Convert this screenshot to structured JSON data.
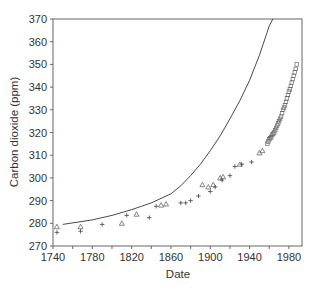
{
  "chart_data": {
    "type": "scatter",
    "title": "",
    "xlabel": "Date",
    "ylabel": "Carbon dioxide (ppm)",
    "xlim": [
      1740,
      1993
    ],
    "ylim": [
      270,
      370
    ],
    "x_ticks": [
      1740,
      1760,
      1780,
      1800,
      1820,
      1840,
      1860,
      1880,
      1900,
      1920,
      1940,
      1960,
      1980
    ],
    "x_tick_labels": [
      "1740",
      "1780",
      "1820",
      "1860",
      "1900",
      "1940",
      "1980"
    ],
    "y_ticks": [
      270,
      280,
      290,
      300,
      310,
      320,
      330,
      340,
      350,
      360,
      370
    ],
    "y_tick_labels": [
      "270",
      "280",
      "290",
      "300",
      "310",
      "320",
      "330",
      "340",
      "350",
      "360",
      "370"
    ],
    "grid": false,
    "legend": null,
    "series": [
      {
        "name": "Model curve",
        "style": "line",
        "x": [
          1750,
          1780,
          1800,
          1820,
          1840,
          1860,
          1870,
          1880,
          1890,
          1900,
          1910,
          1920,
          1930,
          1940,
          1950,
          1960,
          1966
        ],
        "y": [
          279.5,
          281.5,
          283.5,
          286,
          289,
          293,
          296.5,
          301,
          306,
          312,
          318.5,
          326,
          334,
          343,
          354,
          367,
          372
        ]
      },
      {
        "name": "Ice core (triangles)",
        "style": "triangle",
        "x": [
          1744,
          1768,
          1810,
          1825,
          1850,
          1855,
          1892,
          1898,
          1903,
          1910,
          1913,
          1930,
          1950,
          1953
        ],
        "y": [
          278.5,
          278.5,
          280,
          284,
          288,
          288.5,
          297,
          296,
          297,
          300,
          300.5,
          306,
          311,
          312
        ]
      },
      {
        "name": "Ice core (crosses)",
        "style": "cross",
        "x": [
          1744,
          1768,
          1790,
          1815,
          1838,
          1845,
          1870,
          1875,
          1880,
          1888,
          1900,
          1905,
          1912,
          1920,
          1925,
          1932,
          1942
        ],
        "y": [
          276,
          276.5,
          279.5,
          283.5,
          282.5,
          287.5,
          289,
          289,
          290,
          292,
          294,
          296,
          299,
          301,
          305,
          306,
          307
        ]
      },
      {
        "name": "Atmospheric measurements (squares)",
        "style": "square",
        "x": [
          1958,
          1959,
          1960,
          1961,
          1962,
          1963,
          1964,
          1965,
          1966,
          1967,
          1968,
          1969,
          1970,
          1971,
          1972,
          1973,
          1974,
          1975,
          1976,
          1977,
          1978,
          1979,
          1980,
          1981,
          1982,
          1983,
          1984,
          1985,
          1986,
          1987,
          1988
        ],
        "y": [
          315,
          316,
          317,
          317.5,
          318,
          319,
          319.5,
          320,
          321,
          322,
          323,
          324,
          325,
          326,
          327,
          328.5,
          330,
          331,
          332,
          333.5,
          335,
          336.5,
          338,
          339,
          340.5,
          342,
          343.5,
          345,
          346.5,
          348,
          350
        ]
      }
    ]
  }
}
